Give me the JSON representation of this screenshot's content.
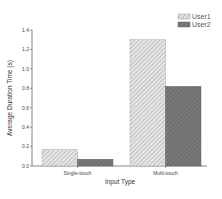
{
  "chart_data": {
    "type": "bar",
    "title": "",
    "xlabel": "Input Type",
    "ylabel": "Average Duration Time (s)",
    "categories": [
      "Single-touch",
      "Multi-touch"
    ],
    "series": [
      {
        "name": "User1",
        "values": [
          0.17,
          1.3
        ],
        "fill": "hatched-light",
        "color": "#d8d8d8"
      },
      {
        "name": "User2",
        "values": [
          0.07,
          0.82
        ],
        "fill": "hatched-dark",
        "color": "#6e6e6e"
      }
    ],
    "ylim": [
      0.0,
      1.4
    ],
    "yticks": [
      "0.0",
      "0.2",
      "0.4",
      "0.6",
      "0.8",
      "1.0",
      "1.2",
      "1.4"
    ],
    "grid": false,
    "legend_position": "top-right"
  }
}
